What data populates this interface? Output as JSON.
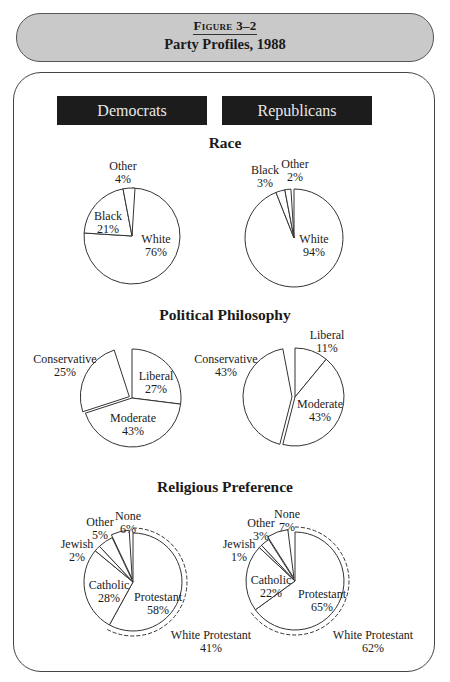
{
  "header": {
    "figure_label": "Figure 3–2",
    "title": "Party Profiles, 1988"
  },
  "columns": {
    "democrats": "Democrats",
    "republicans": "Republicans"
  },
  "sections": {
    "race": "Race",
    "philosophy": "Political Philosophy",
    "religion": "Religious Preference"
  },
  "chart_data": [
    {
      "type": "pie",
      "title": "Race — Democrats",
      "categories": [
        "White",
        "Black",
        "Other"
      ],
      "values": [
        76,
        21,
        4
      ],
      "labels": [
        "76%",
        "21%",
        "4%"
      ]
    },
    {
      "type": "pie",
      "title": "Race — Republicans",
      "categories": [
        "White",
        "Black",
        "Other"
      ],
      "values": [
        94,
        3,
        2
      ],
      "labels": [
        "94%",
        "3%",
        "2%"
      ]
    },
    {
      "type": "pie",
      "title": "Political Philosophy — Democrats",
      "categories": [
        "Liberal",
        "Moderate",
        "Conservative"
      ],
      "values": [
        27,
        43,
        25
      ],
      "labels": [
        "27%",
        "43%",
        "25%"
      ],
      "exploded": "Conservative"
    },
    {
      "type": "pie",
      "title": "Political Philosophy — Republicans",
      "categories": [
        "Liberal",
        "Moderate",
        "Conservative"
      ],
      "values": [
        11,
        43,
        43
      ],
      "labels": [
        "11%",
        "43%",
        "43%"
      ],
      "exploded": "Conservative"
    },
    {
      "type": "pie",
      "title": "Religious Preference — Democrats",
      "categories": [
        "Protestant",
        "Catholic",
        "Jewish",
        "Other",
        "None"
      ],
      "values": [
        58,
        28,
        2,
        5,
        6
      ],
      "labels": [
        "58%",
        "28%",
        "2%",
        "5%",
        "6%"
      ],
      "exploded": "None",
      "annotation": {
        "label": "White Protestant",
        "value": 41,
        "text": "41%"
      }
    },
    {
      "type": "pie",
      "title": "Religious Preference — Republicans",
      "categories": [
        "Protestant",
        "Catholic",
        "Jewish",
        "Other",
        "None"
      ],
      "values": [
        65,
        22,
        1,
        3,
        7
      ],
      "labels": [
        "65%",
        "22%",
        "1%",
        "3%",
        "7%"
      ],
      "exploded": "None",
      "annotation": {
        "label": "White Protestant",
        "value": 62,
        "text": "62%"
      }
    }
  ]
}
